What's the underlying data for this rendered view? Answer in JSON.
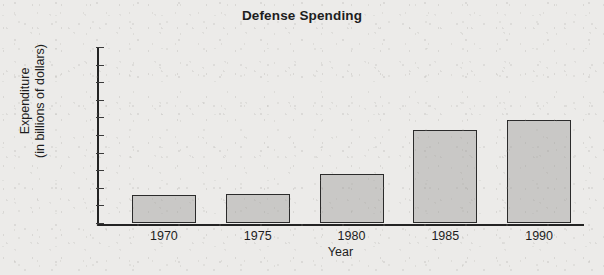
{
  "chart_data": {
    "type": "bar",
    "title": "Defense Spending",
    "xlabel": "Year",
    "ylabel_line1": "Expenditure",
    "ylabel_line2": "(in billions of dollars)",
    "ylabel": "Expenditure (in billions of dollars)",
    "categories": [
      "1970",
      "1975",
      "1980",
      "1985",
      "1990"
    ],
    "values": [
      80,
      82,
      140,
      265,
      293
    ],
    "ylim": [
      0,
      500
    ],
    "yticks": [
      0,
      50,
      100,
      150,
      200,
      250,
      300,
      350,
      400,
      450,
      500
    ],
    "ytick_labels": [
      "0",
      "50",
      "100",
      "150",
      "200",
      "250",
      "300",
      "350",
      "400",
      "450",
      "500"
    ],
    "grid": false,
    "legend": false,
    "legend_position": "none",
    "bar_fill_color": "#c9c8c6",
    "bar_edge_color": "#2b2b2b",
    "axis_color": "#232323",
    "background_color": "#ecebe9",
    "text_color": "#1d1d1d"
  }
}
